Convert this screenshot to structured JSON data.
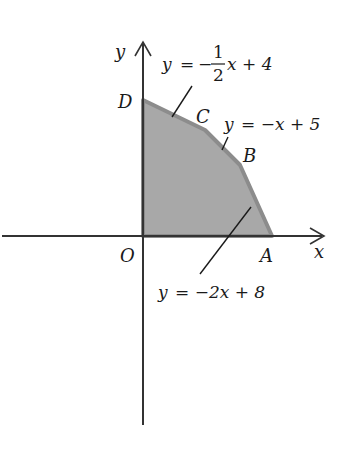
{
  "diagram": {
    "axes": {
      "x_label": "x",
      "y_label": "y",
      "origin_label": "O"
    },
    "region": {
      "fill": "#a9a9a9",
      "edge": "#8a8a8a",
      "vertices": [
        "O",
        "A",
        "B",
        "C",
        "D"
      ]
    },
    "points": {
      "D": "D",
      "C": "C",
      "B": "B",
      "A": "A"
    },
    "equations": {
      "line1": {
        "lhs": "y",
        "eq": "=",
        "minus": "−",
        "num": "1",
        "den": "2",
        "rest": "x + 4"
      },
      "line2": {
        "text_y": "y",
        "text_rest": "= −x + 5"
      },
      "line3": {
        "text_y": "y",
        "text_rest": "= −2x + 8"
      }
    }
  }
}
